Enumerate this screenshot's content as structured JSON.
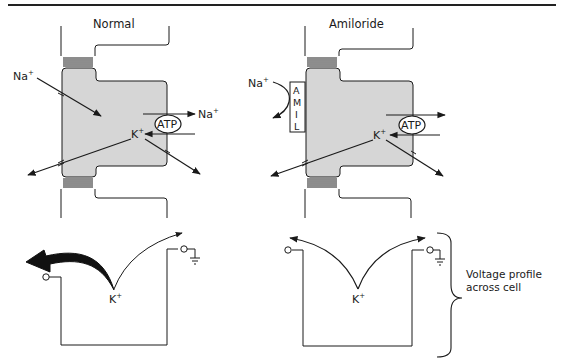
{
  "diagram": {
    "panels": [
      {
        "title": "Normal",
        "apical_ion": "Na",
        "apical_ion_charge": "+",
        "pump_label": "ATP",
        "pump_out_ion": "Na",
        "pump_out_ion_charge": "+",
        "intracellular_ion": "K",
        "intracellular_ion_charge": "+",
        "profile_ion": "K",
        "profile_ion_charge": "+"
      },
      {
        "title": "Amiloride",
        "apical_ion": "Na",
        "apical_ion_charge": "+",
        "blocker_letters": [
          "A",
          "M",
          "I",
          "L"
        ],
        "pump_label": "ATP",
        "intracellular_ion": "K",
        "intracellular_ion_charge": "+",
        "profile_ion": "K",
        "profile_ion_charge": "+"
      }
    ],
    "brace_caption_line1": "Voltage profile",
    "brace_caption_line2": "across cell",
    "colors": {
      "cell_fill": "#d6d6d6",
      "stroke": "#1a1a1a",
      "rule": "#222222"
    }
  }
}
